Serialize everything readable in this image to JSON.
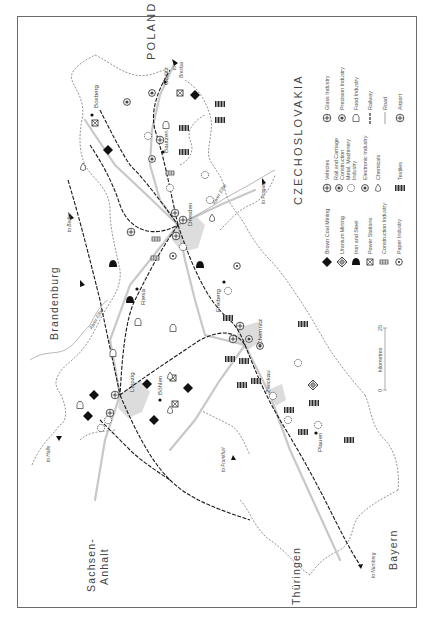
{
  "map": {
    "orientation": "rotated-90-ccw",
    "regions": [
      {
        "id": "brandenburg",
        "label": "Brandenburg"
      },
      {
        "id": "sachsen-anhalt-1",
        "label": "Sachsen-"
      },
      {
        "id": "sachsen-anhalt-2",
        "label": "Anhalt"
      },
      {
        "id": "thueringen",
        "label": "Thüringen"
      },
      {
        "id": "bayern",
        "label": "Bayern"
      },
      {
        "id": "poland",
        "label": "POLAND"
      },
      {
        "id": "czechoslovakia",
        "label": "CZECHOSLOVAKIA"
      }
    ],
    "cities": [
      {
        "id": "leipzig",
        "label": "Leipzig"
      },
      {
        "id": "dresden",
        "label": "Dresden"
      },
      {
        "id": "chemnitz",
        "label": "Chemnitz"
      },
      {
        "id": "zwickau",
        "label": "Zwickau"
      },
      {
        "id": "plauen",
        "label": "Plauen"
      },
      {
        "id": "freiberg",
        "label": "Freiberg"
      },
      {
        "id": "riesa",
        "label": "Riesa"
      },
      {
        "id": "bohlen",
        "label": "Böhlen"
      },
      {
        "id": "bautzen",
        "label": "Bautzen"
      },
      {
        "id": "gorlitz",
        "label": "Görlitz"
      },
      {
        "id": "boxberg",
        "label": "Boxberg"
      }
    ],
    "destinations": [
      {
        "id": "to-berlin",
        "label": "to Berlin"
      },
      {
        "id": "to-halle",
        "label": "to Halle"
      },
      {
        "id": "to-frankfurt",
        "label": "to Frankfurt"
      },
      {
        "id": "to-nurnberg",
        "label": "to Nürnberg"
      },
      {
        "id": "to-prague",
        "label": "to Prague"
      },
      {
        "id": "to-breslau-1",
        "label": "to"
      },
      {
        "id": "to-breslau-2",
        "label": "Breslau"
      }
    ],
    "rivers": [
      {
        "id": "elbe-north",
        "label": "River Elbe"
      },
      {
        "id": "elbe-dresden",
        "label": "River Elbe"
      }
    ],
    "scale": {
      "zero": "0",
      "unit": "kilometres",
      "max": "25"
    }
  },
  "legend": {
    "columns": [
      [
        {
          "icon": "brown-coal-diamond",
          "label": "Brown Coal Mining"
        },
        {
          "icon": "uranium-diamond-cross",
          "label": "Uranium Mining"
        },
        {
          "icon": "iron-steel-bell",
          "label": "Iron and Steel"
        },
        {
          "icon": "power-station-box",
          "label": "Power Stations"
        },
        {
          "icon": "construction-block",
          "label": "Construction Industry"
        },
        {
          "icon": "paper-dot-circle",
          "label": "Paper Industry"
        }
      ],
      [
        {
          "icon": "vehicles-circle",
          "label": "Vehicles"
        },
        {
          "icon": "rail-carriage-gear",
          "label": "Rail and Carriage",
          "label2": "Construction"
        },
        {
          "icon": "metal-machinery-cog",
          "label": "Metal, Machinery",
          "label2": "Industry"
        },
        {
          "icon": "electronic-star",
          "label": "Electronic Industry"
        },
        {
          "icon": "chemicals-drop",
          "label": "Chemicals"
        },
        {
          "icon": "textiles-bars",
          "label": "Textiles"
        }
      ],
      [
        {
          "icon": "glass-circle-t",
          "label": "Glass Industry"
        },
        {
          "icon": "precision-circle",
          "label": "Precision Industry"
        },
        {
          "icon": "food-bottle",
          "label": "Food Industry"
        },
        {
          "icon": "railway-dash",
          "label": "Railway"
        },
        {
          "icon": "road-line",
          "label": "Road"
        },
        {
          "icon": "airport-circle",
          "label": "Airport"
        }
      ]
    ]
  },
  "colors": {
    "ink": "#1a1a1a",
    "road": "#c8c8c8",
    "border": "#777777",
    "frame": "#6a6a6a",
    "urban": "#d9d9d9"
  }
}
